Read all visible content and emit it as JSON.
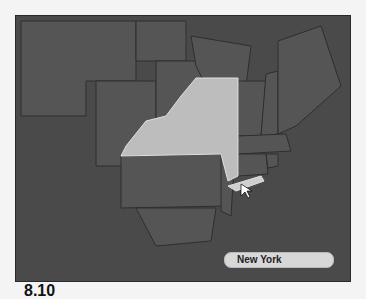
{
  "map": {
    "selected_state": "New York",
    "highlight_color": "#bdbdbd",
    "state_color": "#555555",
    "background_color": "#4a4a4a"
  },
  "caption": "8.10"
}
